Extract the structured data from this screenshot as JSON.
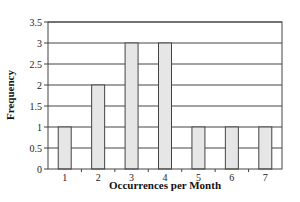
{
  "chart_data": {
    "type": "bar",
    "title": "",
    "xlabel": "Occurrences per Month",
    "ylabel": "Frequency",
    "categories": [
      "1",
      "2",
      "3",
      "4",
      "5",
      "6",
      "7"
    ],
    "values": [
      1,
      2,
      3,
      3,
      1,
      1,
      1
    ],
    "ylim": [
      0,
      3.5
    ],
    "yticks": [
      "0",
      "0.5",
      "1",
      "1.5",
      "2",
      "2.5",
      "3",
      "3.5"
    ],
    "grid": true,
    "legend": null
  },
  "colors": {
    "bar_fill": "#e6e6e6",
    "bar_stroke": "#444444",
    "grid": "#444444",
    "frame": "#444444"
  }
}
